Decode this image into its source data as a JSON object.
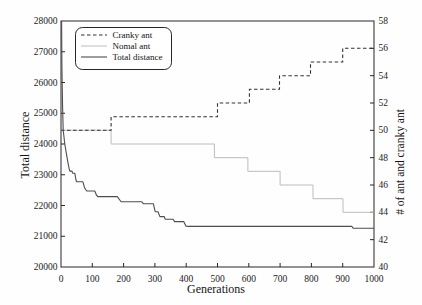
{
  "figure": {
    "background": "#fefefe",
    "axis_color": "#262626",
    "text_color": "#1b1b1b"
  },
  "chart_data": {
    "type": "line",
    "title": "",
    "xlabel": "Generations",
    "ylabel_left": "Total distance",
    "ylabel_right": "# of ant and cranky ant",
    "xlim": [
      0,
      1000
    ],
    "ylim_left": [
      20000,
      28000
    ],
    "ylim_right": [
      40,
      58
    ],
    "x_ticks": [
      0,
      100,
      200,
      300,
      400,
      500,
      600,
      700,
      800,
      900,
      1000
    ],
    "y_ticks_left": [
      20000,
      21000,
      22000,
      23000,
      24000,
      25000,
      26000,
      27000,
      28000
    ],
    "y_ticks_right": [
      40,
      42,
      44,
      46,
      48,
      50,
      52,
      54,
      56,
      58
    ],
    "grid": false,
    "legend_position": "top-left",
    "series": [
      {
        "name": "Cranky ant",
        "axis": "right",
        "style": "dashed",
        "color": "#333333",
        "width": 1.1,
        "points": [
          [
            0,
            50
          ],
          [
            160,
            50
          ],
          [
            160,
            51
          ],
          [
            500,
            51
          ],
          [
            500,
            52
          ],
          [
            602,
            52
          ],
          [
            602,
            53
          ],
          [
            698,
            53
          ],
          [
            698,
            54
          ],
          [
            797,
            54
          ],
          [
            797,
            55
          ],
          [
            900,
            55
          ],
          [
            900,
            56
          ],
          [
            1000,
            56
          ]
        ]
      },
      {
        "name": "Nomal ant",
        "axis": "right",
        "style": "solid",
        "color": "#bcbcbc",
        "width": 1,
        "points": [
          [
            0,
            50
          ],
          [
            160,
            50
          ],
          [
            160,
            49
          ],
          [
            490,
            49
          ],
          [
            490,
            48
          ],
          [
            597,
            48
          ],
          [
            597,
            47
          ],
          [
            700,
            47
          ],
          [
            700,
            46
          ],
          [
            805,
            46
          ],
          [
            805,
            45
          ],
          [
            901,
            45
          ],
          [
            901,
            44
          ],
          [
            1000,
            44
          ]
        ]
      },
      {
        "name": "Total distance",
        "axis": "left",
        "style": "solid",
        "color": "#4e4e4e",
        "width": 1.1,
        "points": [
          [
            2,
            28000
          ],
          [
            3,
            26500
          ],
          [
            5,
            25200
          ],
          [
            7,
            24450
          ],
          [
            12,
            24000
          ],
          [
            17,
            23700
          ],
          [
            22,
            23400
          ],
          [
            26,
            23200
          ],
          [
            28,
            23120
          ],
          [
            35,
            23120
          ],
          [
            37,
            23050
          ],
          [
            44,
            23050
          ],
          [
            48,
            22830
          ],
          [
            50,
            22770
          ],
          [
            70,
            22770
          ],
          [
            76,
            22560
          ],
          [
            82,
            22470
          ],
          [
            108,
            22470
          ],
          [
            113,
            22340
          ],
          [
            118,
            22290
          ],
          [
            180,
            22290
          ],
          [
            192,
            22120
          ],
          [
            258,
            22120
          ],
          [
            263,
            22060
          ],
          [
            295,
            22060
          ],
          [
            301,
            21800
          ],
          [
            310,
            21800
          ],
          [
            316,
            21640
          ],
          [
            330,
            21640
          ],
          [
            333,
            21550
          ],
          [
            358,
            21550
          ],
          [
            363,
            21475
          ],
          [
            392,
            21475
          ],
          [
            399,
            21330
          ],
          [
            408,
            21320
          ],
          [
            929,
            21320
          ],
          [
            934,
            21260
          ],
          [
            1000,
            21260
          ]
        ]
      }
    ]
  }
}
